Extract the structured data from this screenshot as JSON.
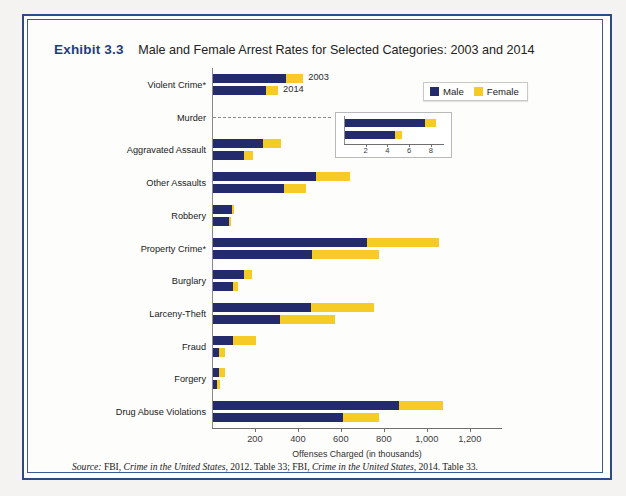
{
  "exhibit": {
    "number": "Exhibit 3.3",
    "title": "Male and Female Arrest Rates for Selected Categories: 2003 and 2014"
  },
  "legend": {
    "male_label": "Male",
    "female_label": "Female",
    "male_color": "#232b6d",
    "female_color": "#f6cb25"
  },
  "series_notes": {
    "note_2003": "2003",
    "note_2014": "2014"
  },
  "source": {
    "label": "Source:",
    "text_1": " FBI, ",
    "italic_1": "Crime in the United States",
    "text_2": ", 2012. Table 33; FBI, ",
    "italic_2": "Crime in the United States",
    "text_3": ", 2014. Table 33."
  },
  "inset": {
    "ticks": [
      "2",
      "4",
      "6",
      "8"
    ],
    "tick_values": [
      2,
      4,
      6,
      8
    ],
    "xmax": 9.2
  },
  "chart_data": {
    "type": "bar",
    "orientation": "horizontal",
    "stacked": true,
    "title": "Male and Female Arrest Rates for Selected Categories: 2003 and 2014",
    "xlabel": "Offenses Charged (in thousands)",
    "ylabel": "",
    "xlim": [
      0,
      1350
    ],
    "xticks": [
      200,
      400,
      600,
      800,
      1000,
      1200
    ],
    "xticklabels": [
      "200",
      "400",
      "600",
      "800",
      "1,000",
      "1,200"
    ],
    "grid": false,
    "legend_position": "top-right",
    "categories": [
      "Violent Crime*",
      "Murder",
      "Aggravated Assault",
      "Other Assaults",
      "Robbery",
      "Property Crime*",
      "Burglary",
      "Larceny-Theft",
      "Fraud",
      "Forgery",
      "Drug Abuse Violations"
    ],
    "years": [
      "2003",
      "2014"
    ],
    "series": [
      {
        "name": "Male",
        "year_2003": [
          340,
          7.4,
          232,
          480,
          90,
          715,
          145,
          455,
          95,
          30,
          865
        ],
        "year_2014": [
          245,
          4.6,
          145,
          330,
          75,
          460,
          95,
          310,
          28,
          18,
          605
        ]
      },
      {
        "name": "Female",
        "year_2003": [
          80,
          1.0,
          83,
          160,
          10,
          335,
          35,
          295,
          105,
          25,
          205
        ],
        "year_2014": [
          58,
          0.6,
          40,
          105,
          10,
          315,
          20,
          260,
          27,
          14,
          170
        ]
      }
    ],
    "totals": {
      "year_2003": [
        420,
        8.4,
        315,
        640,
        100,
        1050,
        180,
        750,
        200,
        55,
        1070
      ],
      "year_2014": [
        303,
        5.2,
        185,
        435,
        85,
        775,
        115,
        570,
        55,
        32,
        775
      ]
    },
    "inset_note": "Murder values shown in separate inset at 0-9 thousand scale"
  }
}
